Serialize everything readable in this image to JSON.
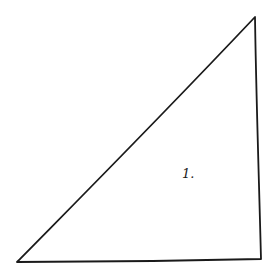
{
  "diagram": {
    "shape": "right-triangle",
    "stroke_color": "#1a1a1a",
    "fill_color": "#ffffff",
    "vertices": [
      [
        17,
        262
      ],
      [
        255,
        17
      ],
      [
        261,
        259
      ]
    ],
    "label": "1."
  }
}
